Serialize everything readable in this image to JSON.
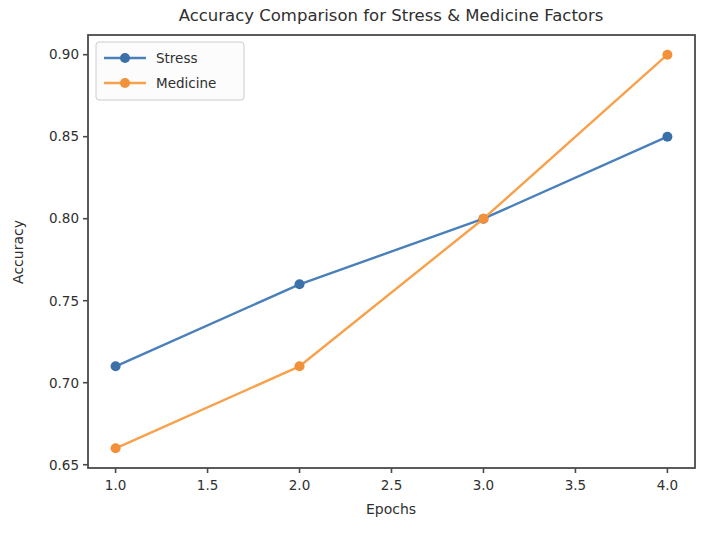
{
  "chart_data": {
    "type": "line",
    "title": "Accuracy Comparison for Stress & Medicine Factors",
    "xlabel": "Epochs",
    "ylabel": "Accuracy",
    "x": [
      1.0,
      2.0,
      3.0,
      4.0
    ],
    "series": [
      {
        "name": "Stress",
        "values": [
          0.71,
          0.76,
          0.8,
          0.85
        ],
        "color": "#4a80ba",
        "marker_color": "#3c70a8"
      },
      {
        "name": "Medicine",
        "values": [
          0.66,
          0.71,
          0.8,
          0.9
        ],
        "color": "#f8a14c",
        "marker_color": "#f2913a"
      }
    ],
    "xlim": [
      0.85,
      4.15
    ],
    "ylim": [
      0.648,
      0.912
    ],
    "xticks": {
      "values": [
        1.0,
        1.5,
        2.0,
        2.5,
        3.0,
        3.5,
        4.0
      ],
      "labels": [
        "1.0",
        "1.5",
        "2.0",
        "2.5",
        "3.0",
        "3.5",
        "4.0"
      ]
    },
    "yticks": {
      "values": [
        0.65,
        0.7,
        0.75,
        0.8,
        0.85,
        0.9
      ],
      "labels": [
        "0.65",
        "0.70",
        "0.75",
        "0.80",
        "0.85",
        "0.90"
      ]
    },
    "legend": {
      "position": "upper left",
      "entries": [
        "Stress",
        "Medicine"
      ]
    },
    "grid": false,
    "axis_color": "#4a4a4a",
    "text_color": "#2f2f2f",
    "legend_bg": "#fcfcfc",
    "legend_border": "#cccccc"
  }
}
